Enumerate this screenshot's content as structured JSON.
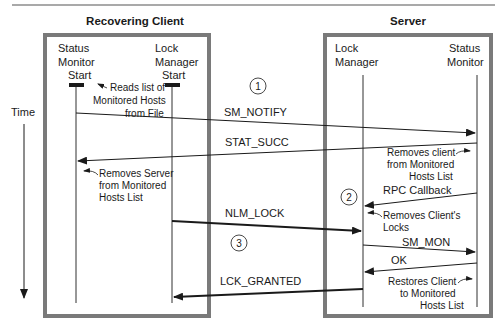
{
  "diagram": {
    "type": "sequence",
    "colors": {
      "box_border": "#7a7a7a",
      "line": "#1a1a1a",
      "rule": "#555555"
    },
    "time_label": "Time",
    "participants": {
      "client": {
        "title": "Recovering Client",
        "status_monitor": {
          "line1": "Status",
          "line2": "Monitor",
          "line3": "Start"
        },
        "lock_manager": {
          "line1": "Lock",
          "line2": "Manager",
          "line3": "Start"
        }
      },
      "server": {
        "title": "Server",
        "lock_manager": {
          "line1": "Lock",
          "line2": "Manager"
        },
        "status_monitor": {
          "line1": "Status",
          "line2": "Monitor"
        }
      }
    },
    "steps": [
      {
        "number": "1"
      },
      {
        "number": "2"
      },
      {
        "number": "3"
      }
    ],
    "messages": [
      {
        "label": "SM_NOTIFY",
        "from": "client.status_monitor",
        "to": "server.status_monitor"
      },
      {
        "label": "STAT_SUCC",
        "from": "server.status_monitor",
        "to": "client.status_monitor"
      },
      {
        "label": "RPC Callback",
        "from": "server.status_monitor",
        "to": "server.lock_manager"
      },
      {
        "label": "NLM_LOCK",
        "from": "client.lock_manager",
        "to": "server.lock_manager"
      },
      {
        "label": "SM_MON",
        "from": "server.lock_manager",
        "to": "server.status_monitor"
      },
      {
        "label": "OK",
        "from": "server.status_monitor",
        "to": "server.lock_manager"
      },
      {
        "label": "LCK_GRANTED",
        "from": "server.lock_manager",
        "to": "client.lock_manager"
      }
    ],
    "notes": {
      "reads_list": {
        "line1": "Reads list of",
        "line2": "Monitored Hosts",
        "line3": "from File"
      },
      "removes_server": {
        "line1": "Removes Server",
        "line2": "from Monitored",
        "line3": "Hosts List"
      },
      "removes_client": {
        "line1": "Removes client",
        "line2": "from Monitored",
        "line3": "Hosts List"
      },
      "removes_locks": {
        "line1": "Removes Client's",
        "line2": "Locks"
      },
      "restores_client": {
        "line1": "Restores Client",
        "line2": "to Monitored",
        "line3": "Hosts List"
      }
    }
  }
}
